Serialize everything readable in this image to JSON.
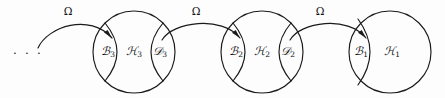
{
  "figure": {
    "type": "mathematical-set-diagram",
    "background_color": "#fdfdfd",
    "stroke_color": "#1a1a1a"
  },
  "ellipsis": {
    "text": "· · ·",
    "cx": 28,
    "cy": 52
  },
  "nodes": [
    {
      "id": "node-3",
      "cx": 134,
      "cy": 52,
      "r": 41,
      "center_label": {
        "letter": "ℋ",
        "subscript": "3",
        "cx": 134,
        "cy": 52
      },
      "left_lens": {
        "letter": "ℬ",
        "subscript": "3",
        "cx": 108,
        "cy": 52
      },
      "right_lens": {
        "letter": "𝒟",
        "subscript": "3",
        "cx": 160,
        "cy": 52
      },
      "has_right_lens": true
    },
    {
      "id": "node-2",
      "cx": 262,
      "cy": 52,
      "r": 41,
      "center_label": {
        "letter": "ℋ",
        "subscript": "2",
        "cx": 262,
        "cy": 52
      },
      "left_lens": {
        "letter": "ℬ",
        "subscript": "2",
        "cx": 236,
        "cy": 52
      },
      "right_lens": {
        "letter": "𝒟",
        "subscript": "2",
        "cx": 288,
        "cy": 52
      },
      "has_right_lens": true
    },
    {
      "id": "node-1",
      "cx": 390,
      "cy": 52,
      "r": 41,
      "center_label": {
        "letter": "ℋ",
        "subscript": "1",
        "cx": 390,
        "cy": 52
      },
      "left_lens": {
        "letter": "ℬ",
        "subscript": "1",
        "cx": 361,
        "cy": 52
      },
      "right_lens": null,
      "has_right_lens": false
    }
  ],
  "arrows": [
    {
      "id": "arrow-3",
      "label": "Ω",
      "label_cx": 68,
      "label_cy": 11,
      "from": "ellipsis-region",
      "to": "node-3-left-lens"
    },
    {
      "id": "arrow-2",
      "label": "Ω",
      "label_cx": 196,
      "label_cy": 11,
      "from": "node-3-right-lens",
      "to": "node-2-left-lens"
    },
    {
      "id": "arrow-1",
      "label": "Ω",
      "label_cx": 320,
      "label_cy": 11,
      "from": "node-2-right-lens",
      "to": "node-1-left-lens"
    }
  ]
}
